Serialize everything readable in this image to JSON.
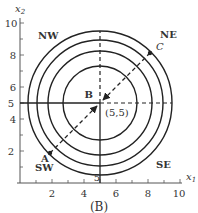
{
  "figure": {
    "caption": "(B)",
    "axes": {
      "x_label": "x",
      "x_sub": "1",
      "y_label": "x",
      "y_sub": "2",
      "x_ticks": [
        "2",
        "4",
        "6",
        "8",
        "10"
      ],
      "y_ticks": [
        "2",
        "4",
        "5",
        "6",
        "8",
        "10"
      ],
      "x_center_tick": "5"
    },
    "regions": {
      "nw": "NW",
      "ne": "NE",
      "sw": "SW",
      "se": "SE"
    },
    "points": {
      "a": "A",
      "b": "B",
      "c": "C",
      "center": "(5,5)"
    },
    "colors": {
      "ink": "#222222",
      "text": "#333333"
    }
  }
}
